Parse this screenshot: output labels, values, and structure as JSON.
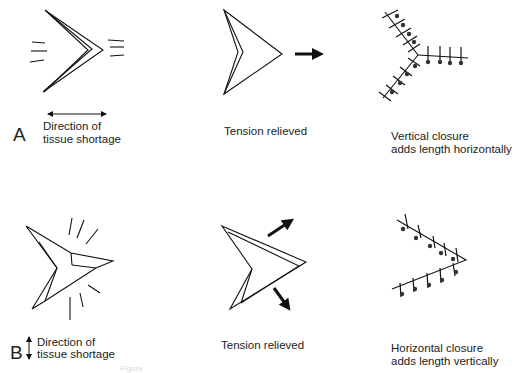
{
  "panels": {
    "A": {
      "letter": "A",
      "direction_line1": "Direction of",
      "direction_line2": "tissue shortage",
      "middle_caption": "Tension relieved",
      "right_line1": "Vertical closure",
      "right_line2": "adds length horizontally"
    },
    "B": {
      "letter": "B",
      "direction_line1": "Direction of",
      "direction_line2": "tissue shortage",
      "middle_caption": "Tension relieved",
      "right_line1": "Horizontal closure",
      "right_line2": "adds length vertically"
    }
  },
  "footer_fragment": "Figure",
  "icons": {
    "double_arrow_horizontal": "double-headed-arrow-horizontal",
    "double_arrow_vertical": "double-headed-arrow-vertical",
    "tension_arrow": "bold-arrow"
  }
}
